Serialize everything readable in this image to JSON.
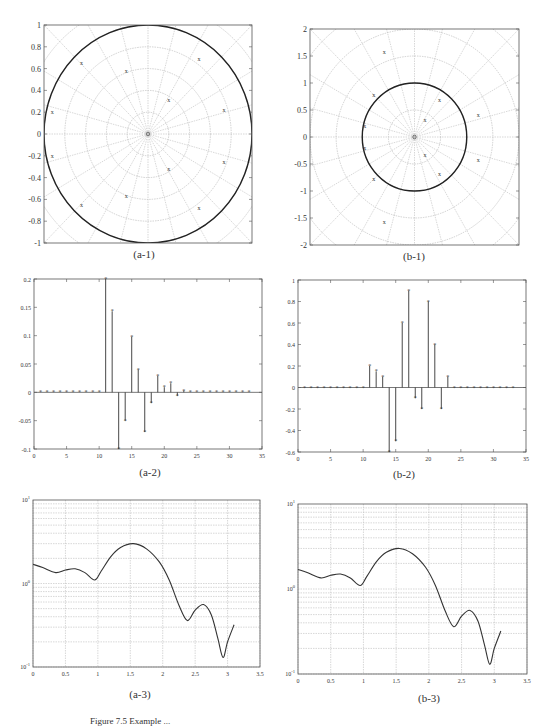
{
  "figure": {
    "caption": "Figure 7.5  Example ...",
    "panels": [
      {
        "id": "a-1",
        "label": "(a-1)"
      },
      {
        "id": "b-1",
        "label": "(b-1)"
      },
      {
        "id": "a-2",
        "label": "(a-2)"
      },
      {
        "id": "b-2",
        "label": "(b-2)"
      },
      {
        "id": "a-3",
        "label": "(a-3)"
      },
      {
        "id": "b-3",
        "label": "(b-3)"
      }
    ]
  },
  "chart_data": [
    {
      "id": "a-1",
      "type": "scatter",
      "subtype": "pole-zero (polar grid)",
      "title": "(a-1)",
      "xlim": [
        -1,
        1
      ],
      "ylim": [
        -1,
        1
      ],
      "yticks": [
        "1",
        "0.8",
        "0.6",
        "0.4",
        "0.2",
        "0",
        "-0.2",
        "-0.4",
        "-0.6",
        "-0.8",
        "-1"
      ],
      "unit_circle_radius": 1,
      "grid": "polar",
      "poles_x": [
        [
          -0.64,
          0.65
        ],
        [
          -0.21,
          0.58
        ],
        [
          0.49,
          0.69
        ],
        [
          0.2,
          0.31
        ],
        [
          0.73,
          0.22
        ],
        [
          -0.92,
          0.2
        ],
        [
          -0.92,
          -0.2
        ],
        [
          0.73,
          -0.26
        ],
        [
          0.2,
          -0.32
        ],
        [
          -0.21,
          -0.57
        ],
        [
          -0.64,
          -0.65
        ],
        [
          0.49,
          -0.68
        ]
      ]
    },
    {
      "id": "b-1",
      "type": "scatter",
      "subtype": "pole-zero (polar grid)",
      "title": "(b-1)",
      "xlim": [
        -2,
        2
      ],
      "ylim": [
        -2,
        2
      ],
      "yticks": [
        "2",
        "1.5",
        "1",
        "0.5",
        "0",
        "-0.5",
        "-1",
        "-1.5",
        "-2"
      ],
      "unit_circle_radius": 1,
      "grid": "polar",
      "poles_x": [
        [
          -0.58,
          1.58
        ],
        [
          -0.78,
          0.78
        ],
        [
          0.48,
          0.69
        ],
        [
          0.2,
          0.31
        ],
        [
          1.22,
          0.4
        ],
        [
          -0.95,
          0.2
        ],
        [
          -0.95,
          -0.2
        ],
        [
          0.2,
          -0.33
        ],
        [
          0.48,
          -0.69
        ],
        [
          1.22,
          -0.43
        ],
        [
          -0.78,
          -0.78
        ],
        [
          -0.58,
          -1.58
        ]
      ]
    },
    {
      "id": "a-2",
      "type": "stem",
      "title": "(a-2)",
      "xlim": [
        0,
        35
      ],
      "ylim": [
        -0.1,
        0.2
      ],
      "xticks": [
        "0",
        "5",
        "10",
        "15",
        "20",
        "25",
        "30",
        "35"
      ],
      "yticks": [
        "0.2",
        "0.15",
        "0.1",
        "0.05",
        "0",
        "-0.05",
        "-0.1"
      ],
      "x": [
        1,
        2,
        3,
        4,
        5,
        6,
        7,
        8,
        9,
        10,
        11,
        12,
        13,
        14,
        15,
        16,
        17,
        18,
        19,
        20,
        21,
        22,
        23,
        24,
        25,
        26,
        27,
        28,
        29,
        30,
        31,
        32,
        33
      ],
      "values": [
        0,
        0,
        0,
        0,
        0,
        0,
        0,
        0,
        0,
        0,
        0.2,
        0.143,
        -0.1,
        -0.05,
        0.098,
        0.04,
        -0.07,
        -0.019,
        0.029,
        0.009,
        0.016,
        -0.006,
        0.003,
        0,
        0,
        0,
        0,
        0,
        0,
        0,
        0,
        0,
        0
      ]
    },
    {
      "id": "b-2",
      "type": "stem",
      "title": "(b-2)",
      "xlim": [
        0,
        35
      ],
      "ylim": [
        -0.6,
        1
      ],
      "xticks": [
        "0",
        "5",
        "10",
        "15",
        "20",
        "25",
        "30",
        "35"
      ],
      "yticks": [
        "1",
        "0.8",
        "0.6",
        "0.4",
        "0.2",
        "0",
        "-0.2",
        "-0.4",
        "-0.6"
      ],
      "x": [
        1,
        2,
        3,
        4,
        5,
        6,
        7,
        8,
        9,
        10,
        11,
        12,
        13,
        14,
        15,
        16,
        17,
        18,
        19,
        20,
        21,
        22,
        23,
        24,
        25,
        26,
        27,
        28,
        29,
        30,
        31,
        32,
        33
      ],
      "values": [
        0,
        0,
        0,
        0,
        0,
        0,
        0,
        0,
        0,
        0,
        0.2,
        0.15,
        0.1,
        -0.6,
        -0.5,
        0.6,
        0.9,
        -0.1,
        -0.2,
        0.8,
        0.4,
        -0.2,
        0.1,
        0,
        0,
        0,
        0,
        0,
        0,
        0,
        0,
        0,
        0
      ]
    },
    {
      "id": "a-3",
      "type": "line",
      "title": "(a-3)",
      "yscale": "log",
      "xlim": [
        0,
        3.5
      ],
      "ylim": [
        0.1,
        10
      ],
      "xticks": [
        "0",
        "0.5",
        "1",
        "1.5",
        "2",
        "2.5",
        "3",
        "3.5"
      ],
      "yticks": [
        "10^1",
        "10^0",
        "10^-1"
      ],
      "grid": true,
      "x": [
        0,
        0.15,
        0.35,
        0.5,
        0.65,
        0.8,
        0.95,
        1.05,
        1.2,
        1.35,
        1.55,
        1.75,
        1.95,
        2.1,
        2.25,
        2.38,
        2.5,
        2.63,
        2.75,
        2.85,
        2.93,
        3.0,
        3.1
      ],
      "values": [
        1.7,
        1.55,
        1.35,
        1.45,
        1.5,
        1.35,
        1.1,
        1.4,
        2.1,
        2.7,
        3.0,
        2.6,
        1.8,
        1.1,
        0.55,
        0.36,
        0.48,
        0.56,
        0.42,
        0.22,
        0.13,
        0.2,
        0.32
      ]
    },
    {
      "id": "b-3",
      "type": "line",
      "title": "(b-3)",
      "yscale": "log",
      "xlim": [
        0,
        3.5
      ],
      "ylim": [
        0.1,
        10
      ],
      "xticks": [
        "0",
        "0.5",
        "1",
        "1.5",
        "2",
        "2.5",
        "3",
        "3.5"
      ],
      "yticks": [
        "10^1",
        "10^0",
        "10^-1"
      ],
      "grid": true,
      "x": [
        0,
        0.15,
        0.35,
        0.5,
        0.65,
        0.8,
        0.95,
        1.05,
        1.2,
        1.35,
        1.55,
        1.75,
        1.95,
        2.1,
        2.25,
        2.38,
        2.5,
        2.63,
        2.75,
        2.85,
        2.93,
        3.0,
        3.1
      ],
      "values": [
        1.7,
        1.55,
        1.35,
        1.45,
        1.5,
        1.35,
        1.1,
        1.4,
        2.1,
        2.7,
        3.0,
        2.6,
        1.8,
        1.1,
        0.55,
        0.36,
        0.48,
        0.56,
        0.42,
        0.22,
        0.13,
        0.2,
        0.32
      ]
    }
  ]
}
